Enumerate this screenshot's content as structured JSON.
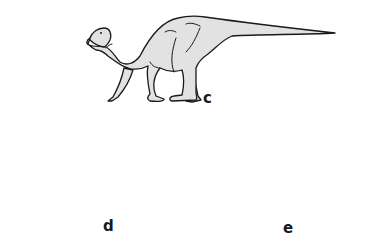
{
  "figure": {
    "background": "#ffffff",
    "fill_color": "#e2e2e2",
    "outline_color": "#1a1a1a",
    "panels": [
      {
        "id": "c",
        "label": "c",
        "pose": "quadrupedal-walking",
        "description": "hadrosaur walking on all fours, tail held horizontal"
      },
      {
        "id": "d",
        "label": "d",
        "pose": "bipedal-upright",
        "description": "hadrosaur standing upright, tail on ground"
      },
      {
        "id": "e",
        "label": "e",
        "pose": "bipedal-running",
        "description": "hadrosaur running on hind legs, tail extended"
      }
    ]
  }
}
